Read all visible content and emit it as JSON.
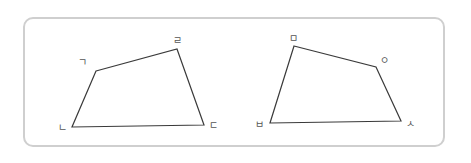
{
  "figure": {
    "colors": {
      "frame_border": "#cfcfcf",
      "edge": "#3a3a3a",
      "label": "#555555"
    },
    "shapes": [
      {
        "name": "quadrilateral-1",
        "vertices": [
          {
            "label": "ㄱ",
            "pos": [
              96,
              71
            ],
            "label_pos": [
              87,
              66
            ],
            "anchor": "end"
          },
          {
            "label": "ㄹ",
            "pos": [
              177,
              49
            ],
            "label_pos": [
              177,
              44
            ],
            "anchor": "middle"
          },
          {
            "label": "ㄷ",
            "pos": [
              204,
              125
            ],
            "label_pos": [
              209,
              129
            ],
            "anchor": "start"
          },
          {
            "label": "ㄴ",
            "pos": [
              72,
              127
            ],
            "label_pos": [
              67,
              131
            ],
            "anchor": "end"
          }
        ]
      },
      {
        "name": "quadrilateral-2",
        "vertices": [
          {
            "label": "ㅁ",
            "pos": [
              294,
              46
            ],
            "label_pos": [
              293,
              42
            ],
            "anchor": "middle"
          },
          {
            "label": "ㅇ",
            "pos": [
              376,
              67
            ],
            "label_pos": [
              380,
              64
            ],
            "anchor": "start"
          },
          {
            "label": "ㅅ",
            "pos": [
              401,
              121
            ],
            "label_pos": [
              406,
              127
            ],
            "anchor": "start"
          },
          {
            "label": "ㅂ",
            "pos": [
              270,
              123
            ],
            "label_pos": [
              264,
              128
            ],
            "anchor": "end"
          }
        ]
      }
    ]
  }
}
